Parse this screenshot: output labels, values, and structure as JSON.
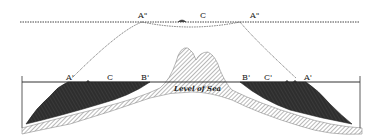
{
  "diagram": {
    "type": "geological-cross-section",
    "colors": {
      "background": "#ffffff",
      "line": "#333333",
      "dark_fill": "#2a2a2a",
      "hatch": "#888888"
    },
    "labels": {
      "top_left_A": "A\"",
      "top_right_A": "A\"",
      "top_center_C": "C",
      "left_A": "A'",
      "left_C": "C",
      "left_B": "B'",
      "right_B": "B'",
      "right_C": "C'",
      "right_A": "A'",
      "sea_level": "Level of Sea"
    }
  }
}
